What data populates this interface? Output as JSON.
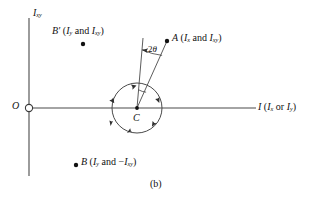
{
  "figure": {
    "caption": "(b)",
    "colors": {
      "line": "#3a3a3a",
      "text": "#111111",
      "background": "#ffffff"
    }
  },
  "axes": {
    "vertical": {
      "label_main": "I",
      "label_sub": "xy"
    },
    "horizontal": {
      "label_main": "I",
      "label_paren_open": "(",
      "label_term1_main": "I",
      "label_term1_sub": "x",
      "label_conjunction": "or",
      "label_term2_main": "I",
      "label_term2_sub": "y",
      "label_paren_close": ")"
    },
    "origin": {
      "label": "O"
    }
  },
  "points": {
    "a": {
      "label": "A",
      "paren_open": "(",
      "term1_main": "I",
      "term1_sub": "x",
      "conjunction": "and",
      "term2_main": "I",
      "term2_sub": "xy",
      "paren_close": ")",
      "x": 167,
      "y": 41
    },
    "b_prime": {
      "label": "B′",
      "paren_open": "(",
      "term1_main": "I",
      "term1_sub": "y",
      "conjunction": "and",
      "term2_main": "I",
      "term2_sub": "xy",
      "paren_close": ")",
      "x": 83,
      "y": 44
    },
    "b": {
      "label": "B",
      "paren_open": "(",
      "term1_main": "I",
      "term1_sub": "y",
      "conjunction": "and",
      "term2_sign": "−",
      "term2_main": "I",
      "term2_sub": "xy",
      "paren_close": ")",
      "x": 76,
      "y": 165
    },
    "center": {
      "label": "C",
      "x": 137,
      "y": 108
    }
  },
  "angle": {
    "label_number": "2",
    "label_symbol": "θ"
  },
  "circle": {
    "center_x": 137,
    "center_y": 108,
    "radius": 25,
    "rotation_arrow_count": 6
  }
}
